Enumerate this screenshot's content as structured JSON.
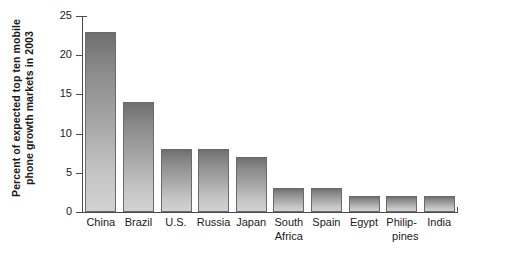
{
  "chart_data": {
    "type": "bar",
    "title": "",
    "subtitle": "",
    "xlabel": "",
    "ylabel": "Percent of expected top ten mobile phone growth markets in 2003",
    "ylabel_lines": [
      "Percent of expected top ten mobile",
      "phone growth markets in 2003"
    ],
    "categories": [
      "China",
      "Brazil",
      "U.S.",
      "Russia",
      "Japan",
      "South Africa",
      "Spain",
      "Egypt",
      "Philippines",
      "India"
    ],
    "category_lines": [
      [
        "China"
      ],
      [
        "Brazil"
      ],
      [
        "U.S."
      ],
      [
        "Russia"
      ],
      [
        "Japan"
      ],
      [
        "South",
        "Africa"
      ],
      [
        "Spain"
      ],
      [
        "Egypt"
      ],
      [
        "Philip-",
        "pines"
      ],
      [
        "India"
      ]
    ],
    "values": [
      23,
      14,
      8,
      8,
      7,
      3,
      3,
      2,
      2,
      2
    ],
    "ylim": [
      0,
      25
    ],
    "ytick_values": [
      0,
      5,
      10,
      15,
      20,
      25
    ],
    "ytick_labels": [
      "0",
      "5",
      "10",
      "15",
      "20",
      "25"
    ],
    "grid": false,
    "legend": false,
    "legend_position": "none",
    "bar_color_top": "#6f6f6f",
    "bar_color_bottom": "#d2d2d2",
    "bar_edge_color": "#6a6a6a",
    "axis_color": "#4a4a4a",
    "background_color": "#ffffff"
  }
}
